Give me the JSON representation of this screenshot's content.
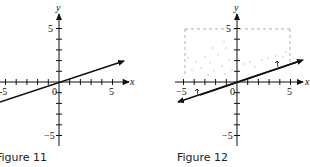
{
  "figures": [
    {
      "caption": "Figure 11",
      "x_axis_label": "x",
      "y_axis_label": "y",
      "tick_labels": {
        "x_pos": "5",
        "x_neg": "-5",
        "y_pos": "5",
        "y_neg": "−5",
        "origin": "0"
      },
      "line": {
        "slope": 0.333,
        "intercept": 0
      },
      "shaded_region": false
    },
    {
      "caption": "Figure 12",
      "x_axis_label": "x",
      "y_axis_label": "y",
      "tick_labels": {
        "x_pos": "5",
        "x_neg": "−5",
        "y_pos": "5",
        "y_neg": "−5",
        "origin": "0"
      },
      "line": {
        "slope": 0.333,
        "intercept": 0
      },
      "shaded_region": true,
      "region_bounds": {
        "x_min": -5,
        "x_max": 5,
        "y_max": 5
      }
    }
  ]
}
